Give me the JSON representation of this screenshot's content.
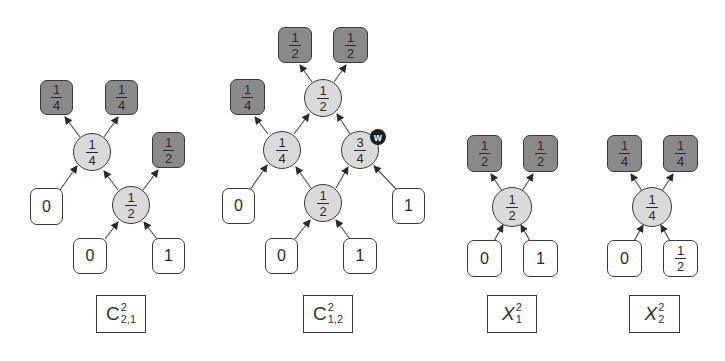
{
  "colors": {
    "output_box": "#8a8a8a",
    "input_box": "#ffffff",
    "gate": "#dadada",
    "border": "#3a3a3a",
    "badge": "#1e1e1e"
  },
  "diagrams": [
    {
      "id": "C21",
      "label": {
        "base": "C",
        "sup": "2",
        "sub": "2,1",
        "italic": false
      },
      "nodes": {
        "out1": {
          "type": "output",
          "num": "1",
          "den": "4"
        },
        "out2": {
          "type": "output",
          "num": "1",
          "den": "4"
        },
        "out3": {
          "type": "output",
          "num": "1",
          "den": "2"
        },
        "g1": {
          "type": "gate",
          "num": "1",
          "den": "4"
        },
        "g2": {
          "type": "gate",
          "num": "1",
          "den": "2"
        },
        "in1": {
          "type": "input",
          "value": "0"
        },
        "in2": {
          "type": "input",
          "value": "0"
        },
        "in3": {
          "type": "input",
          "value": "1"
        }
      }
    },
    {
      "id": "C12",
      "label": {
        "base": "C",
        "sup": "2",
        "sub": "1,2",
        "italic": false
      },
      "nodes": {
        "out1": {
          "type": "output",
          "num": "1",
          "den": "2"
        },
        "out2": {
          "type": "output",
          "num": "1",
          "den": "2"
        },
        "out3": {
          "type": "output",
          "num": "1",
          "den": "4"
        },
        "g_top": {
          "type": "gate",
          "num": "1",
          "den": "2"
        },
        "g_left": {
          "type": "gate",
          "num": "1",
          "den": "4"
        },
        "g_right": {
          "type": "gate",
          "num": "3",
          "den": "4",
          "badge": "w"
        },
        "g_bottom": {
          "type": "gate",
          "num": "1",
          "den": "2"
        },
        "in1": {
          "type": "input",
          "value": "0"
        },
        "in2": {
          "type": "input",
          "value": "1"
        },
        "in3": {
          "type": "input",
          "value": "0"
        },
        "in4": {
          "type": "input",
          "value": "1"
        }
      }
    },
    {
      "id": "X1",
      "label": {
        "base": "X",
        "sup": "2",
        "sub": "1",
        "italic": true
      },
      "nodes": {
        "out1": {
          "type": "output",
          "num": "1",
          "den": "2"
        },
        "out2": {
          "type": "output",
          "num": "1",
          "den": "2"
        },
        "g1": {
          "type": "gate",
          "num": "1",
          "den": "2"
        },
        "in1": {
          "type": "input",
          "value": "0"
        },
        "in2": {
          "type": "input",
          "value": "1"
        }
      }
    },
    {
      "id": "X2",
      "label": {
        "base": "X",
        "sup": "2",
        "sub": "2",
        "italic": true
      },
      "nodes": {
        "out1": {
          "type": "output",
          "num": "1",
          "den": "4"
        },
        "out2": {
          "type": "output",
          "num": "1",
          "den": "4"
        },
        "g1": {
          "type": "gate",
          "num": "1",
          "den": "4"
        },
        "in1": {
          "type": "input",
          "value": "0"
        },
        "in2": {
          "type": "input",
          "num": "1",
          "den": "2"
        }
      }
    }
  ]
}
